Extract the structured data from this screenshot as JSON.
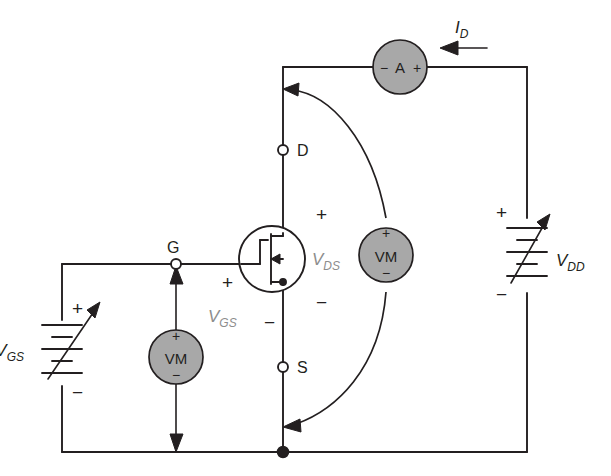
{
  "figure": {
    "background_color": "#ffffff",
    "wire_color": "#231f20",
    "meter_fill_color": "#a8a8a8",
    "gray_label_color": "#8d8d8d"
  },
  "terminals": {
    "gate": "G",
    "drain": "D",
    "source": "S"
  },
  "meters": {
    "ammeter": {
      "label": "A",
      "minus": "−",
      "plus": "+",
      "name": "ammeter"
    },
    "voltmeter_ds": {
      "label": "VM",
      "plus": "+",
      "minus": "−",
      "name": "drain-source-voltmeter"
    },
    "voltmeter_gs": {
      "label": "VM",
      "plus": "+",
      "minus": "−",
      "name": "gate-source-voltmeter"
    }
  },
  "sources": {
    "vgs": {
      "symbol": "V",
      "subscript": "GS",
      "plus": "+",
      "minus": "−",
      "type": "variable-dc-supply"
    },
    "vdd": {
      "symbol": "V",
      "subscript": "DD",
      "plus": "+",
      "minus": "−",
      "type": "variable-dc-supply"
    }
  },
  "quantities": {
    "drain_current": {
      "symbol": "I",
      "subscript": "D",
      "direction": "left"
    },
    "vds": {
      "symbol": "V",
      "subscript": "DS",
      "plus": "+",
      "minus": "−"
    },
    "vgs_device": {
      "symbol": "V",
      "subscript": "GS",
      "plus": "+",
      "minus": "−"
    }
  },
  "device": {
    "type": "n-channel-enhancement-mosfet",
    "name": "mosfet"
  }
}
